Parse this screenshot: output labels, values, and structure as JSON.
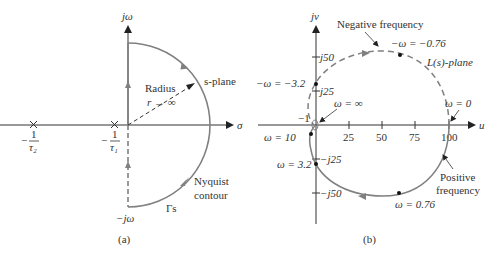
{
  "figure_a": {
    "caption": "(a)",
    "y_axis_label": "jω",
    "y_axis_bottom_label": "−jω",
    "x_axis_label": "σ",
    "pole1_label_num": "1",
    "pole1_label_den": "τ₂",
    "pole1_sign": "−",
    "pole2_label_num": "1",
    "pole2_label_den": "τ₁",
    "pole2_sign": "−",
    "radius_label": "Radius",
    "radius_limit": "r → ∞",
    "plane_label": "s-plane",
    "contour_label_1": "Nyquist",
    "contour_label_2": "contour",
    "gamma_label": "Γs"
  },
  "figure_b": {
    "caption": "(b)",
    "y_axis_label": "jv",
    "x_axis_label": "u",
    "x_ticks": [
      "25",
      "50",
      "75",
      "100"
    ],
    "y_ticks": [
      "j50",
      "j25",
      "−j25",
      "−j50"
    ],
    "minus_one_label": "−1",
    "plane_label": "L(s)-plane",
    "negative_freq_label": "Negative frequency",
    "positive_freq_label_1": "Positive",
    "positive_freq_label_2": "frequency",
    "points": [
      {
        "label": "−ω = −0.76"
      },
      {
        "label": "−ω = −3.2"
      },
      {
        "label": "ω = ∞"
      },
      {
        "label": "ω = 0"
      },
      {
        "label": "ω = 10"
      },
      {
        "label": "ω = 3.2"
      },
      {
        "label": "ω = 0.76"
      }
    ]
  },
  "colors": {
    "axis": "#333333",
    "contour": "#808080",
    "text": "#333333"
  }
}
